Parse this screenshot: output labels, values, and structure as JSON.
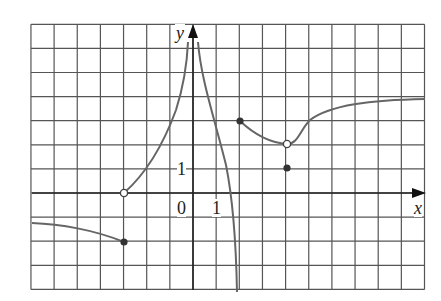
{
  "figure": {
    "axes": {
      "x_label": "x",
      "y_label": "y",
      "origin_label": "0",
      "x_tick_label": "1",
      "y_tick_label": "1"
    },
    "grid": {
      "x_range": [
        -7,
        10
      ],
      "y_range": [
        -4,
        7
      ],
      "step": 1
    },
    "colors": {
      "grid": "#555555",
      "axis": "#222222",
      "curve": "#666666",
      "dot": "#333333"
    },
    "points": [
      {
        "x": -3,
        "y": -2,
        "type": "filled"
      },
      {
        "x": -3,
        "y": 0,
        "type": "open"
      },
      {
        "x": 2,
        "y": 3,
        "type": "filled"
      },
      {
        "x": 4,
        "y": 2,
        "type": "open"
      },
      {
        "x": 4,
        "y": 1,
        "type": "filled"
      }
    ],
    "asymptotes": [
      {
        "type": "vertical",
        "x": 0
      },
      {
        "type": "vertical",
        "x": 2
      },
      {
        "type": "horizontal",
        "y": 4,
        "direction": "x→+∞"
      }
    ]
  }
}
